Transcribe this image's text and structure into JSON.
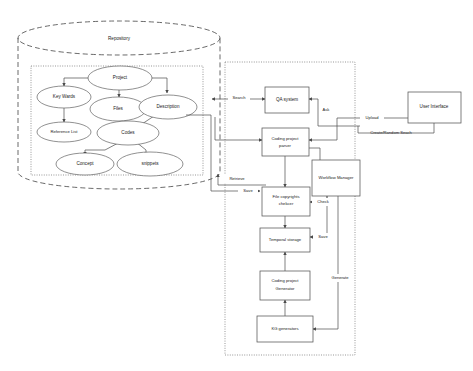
{
  "diagram": {
    "repository": {
      "label": "Repository",
      "nodes": [
        {
          "id": "project",
          "label": "Project"
        },
        {
          "id": "key-words",
          "label": "Key Wards"
        },
        {
          "id": "files",
          "label": "Files"
        },
        {
          "id": "description",
          "label": "Description"
        },
        {
          "id": "reference-list",
          "label": "Reference List"
        },
        {
          "id": "codes",
          "label": "Codes"
        },
        {
          "id": "concept",
          "label": "Concept"
        },
        {
          "id": "snippets",
          "label": "snippets"
        }
      ]
    },
    "workflow": {
      "nodes": [
        {
          "id": "qa-system",
          "label": "QA system"
        },
        {
          "id": "coding-project-parser",
          "label": "Coding project parser"
        },
        {
          "id": "file-copyrights-checker",
          "label": "File copyrights chekcer"
        },
        {
          "id": "temporal-storage",
          "label": "Temporal storage"
        },
        {
          "id": "coding-project-generator",
          "label": "Coding project Generator"
        },
        {
          "id": "kg-generators",
          "label": "KG generators"
        },
        {
          "id": "workflow-manager",
          "label": "Workflow Manager"
        }
      ]
    },
    "external": {
      "nodes": [
        {
          "id": "user-interface",
          "label": "User Interface"
        }
      ]
    },
    "edge_labels": [
      {
        "id": "search",
        "label": "Search"
      },
      {
        "id": "retrieve",
        "label": "Retrieve"
      },
      {
        "id": "save-left",
        "label": "Save"
      },
      {
        "id": "ask",
        "label": "Ask"
      },
      {
        "id": "upload",
        "label": "Upload"
      },
      {
        "id": "create-random-search",
        "label": "Create/Random Seach"
      },
      {
        "id": "check",
        "label": "Check"
      },
      {
        "id": "save-right",
        "label": "Save"
      },
      {
        "id": "generate",
        "label": "Generate"
      }
    ],
    "colors": {
      "stroke": "#555555",
      "text": "#1a1a1a",
      "background": "#ffffff",
      "container_stroke": "#444444"
    }
  }
}
